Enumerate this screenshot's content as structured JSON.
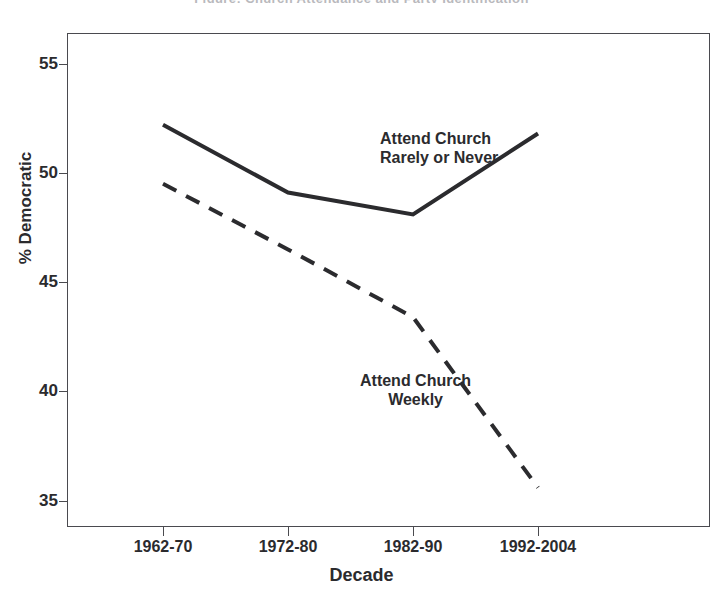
{
  "figure": {
    "cropped_title": "Figure: Church Attendance and Party Identification",
    "background_color": "#ffffff",
    "ink_color": "#2b2b2e"
  },
  "axes": {
    "y_title": "% Democratic",
    "x_title": "Decade",
    "y_ticks": [
      "55",
      "50",
      "45",
      "40",
      "35"
    ],
    "x_ticks": [
      "1962-70",
      "1972-80",
      "1982-90",
      "1992-2004"
    ]
  },
  "annotations": [
    {
      "id": "rarely",
      "line1": "Attend Church",
      "line2": "Rarely or Never"
    },
    {
      "id": "weekly",
      "line1": "Attend Church",
      "line2": "Weekly"
    }
  ],
  "chart_data": {
    "type": "line",
    "title": "",
    "xlabel": "Decade",
    "ylabel": "% Democratic",
    "categories": [
      "1962-70",
      "1972-80",
      "1982-90",
      "1992-2004"
    ],
    "xlim": [
      0,
      3
    ],
    "ylim": [
      33.8,
      56.4
    ],
    "grid": false,
    "legend": "inline-annotations",
    "series": [
      {
        "name": "Attend Church Rarely or Never",
        "style": "solid",
        "color": "#2b2b2e",
        "width": 4,
        "values": [
          52.2,
          49.1,
          48.1,
          51.8
        ]
      },
      {
        "name": "Attend Church Weekly",
        "style": "dashed",
        "color": "#2b2b2e",
        "width": 4,
        "values": [
          49.5,
          46.5,
          43.4,
          35.6
        ]
      }
    ]
  }
}
